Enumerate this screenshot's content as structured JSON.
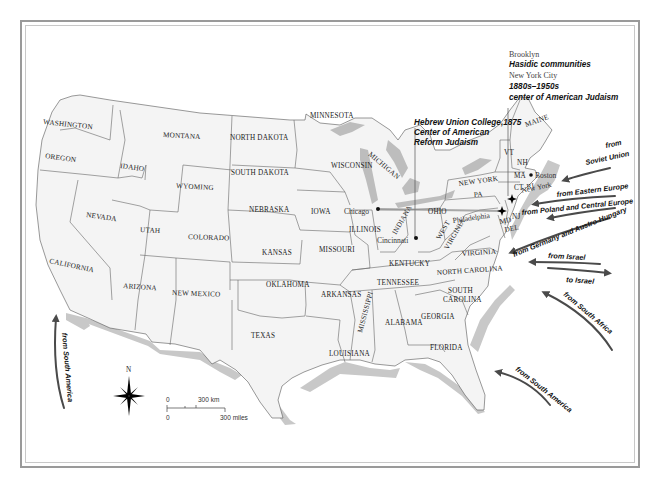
{
  "map": {
    "title": "Jewish immigration to the United States",
    "states": [
      {
        "id": "WA",
        "label": "WASHINGTON",
        "x": 43,
        "y": 124,
        "rot": 6
      },
      {
        "id": "OR",
        "label": "OREGON",
        "x": 45,
        "y": 158,
        "rot": 8
      },
      {
        "id": "CA",
        "label": "CALIFORNIA",
        "x": 49,
        "y": 263,
        "rot": 12
      },
      {
        "id": "ID",
        "label": "IDAHO",
        "x": 120,
        "y": 168,
        "rot": 8
      },
      {
        "id": "NV",
        "label": "NEVADA",
        "x": 86,
        "y": 217,
        "rot": 8
      },
      {
        "id": "MT",
        "label": "MONTANA",
        "x": 163,
        "y": 137,
        "rot": 3
      },
      {
        "id": "WY",
        "label": "WYOMING",
        "x": 176,
        "y": 188,
        "rot": 3
      },
      {
        "id": "UT",
        "label": "UTAH",
        "x": 140,
        "y": 232,
        "rot": 3
      },
      {
        "id": "CO",
        "label": "COLORADO",
        "x": 188,
        "y": 239,
        "rot": 2
      },
      {
        "id": "AZ",
        "label": "ARIZONA",
        "x": 123,
        "y": 288,
        "rot": 4
      },
      {
        "id": "NM",
        "label": "NEW MEXICO",
        "x": 172,
        "y": 295,
        "rot": 2
      },
      {
        "id": "ND",
        "label": "NORTH DAKOTA",
        "x": 230,
        "y": 140,
        "rot": 0
      },
      {
        "id": "SD",
        "label": "SOUTH DAKOTA",
        "x": 231,
        "y": 175,
        "rot": 0
      },
      {
        "id": "NE",
        "label": "NEBRASKA",
        "x": 249,
        "y": 212,
        "rot": 0
      },
      {
        "id": "KS",
        "label": "KANSAS",
        "x": 262,
        "y": 255,
        "rot": 0
      },
      {
        "id": "OK",
        "label": "OKLAHOMA",
        "x": 266,
        "y": 287,
        "rot": 0
      },
      {
        "id": "TX",
        "label": "TEXAS",
        "x": 251,
        "y": 338,
        "rot": 0
      },
      {
        "id": "MN",
        "label": "MINNESOTA",
        "x": 310,
        "y": 118,
        "rot": 0
      },
      {
        "id": "IA",
        "label": "IOWA",
        "x": 311,
        "y": 214,
        "rot": 0
      },
      {
        "id": "MO",
        "label": "MISSOURI",
        "x": 319,
        "y": 252,
        "rot": 0
      },
      {
        "id": "AR",
        "label": "ARKANSAS",
        "x": 321,
        "y": 297,
        "rot": 0
      },
      {
        "id": "LA",
        "label": "LOUISIANA",
        "x": 329,
        "y": 356,
        "rot": 0
      },
      {
        "id": "WI",
        "label": "WISCONSIN",
        "x": 331,
        "y": 168,
        "rot": 0
      },
      {
        "id": "MI",
        "label": "MICHIGAN",
        "x": 368,
        "y": 155,
        "rot": 40
      },
      {
        "id": "IL",
        "label": "ILLINOIS",
        "x": 349,
        "y": 232,
        "rot": 0
      },
      {
        "id": "IN",
        "label": "INDIANA",
        "x": 396,
        "y": 235,
        "rot": -60
      },
      {
        "id": "OH",
        "label": "OHIO",
        "x": 428,
        "y": 214,
        "rot": 0
      },
      {
        "id": "KY",
        "label": "KENTUCKY",
        "x": 389,
        "y": 266,
        "rot": 0
      },
      {
        "id": "TN",
        "label": "TENNESSEE",
        "x": 377,
        "y": 285,
        "rot": 0
      },
      {
        "id": "MS",
        "label": "MISSISSIPPI",
        "x": 362,
        "y": 333,
        "rot": -75
      },
      {
        "id": "AL",
        "label": "ALABAMA",
        "x": 385,
        "y": 325,
        "rot": 0
      },
      {
        "id": "GA",
        "label": "GEORGIA",
        "x": 421,
        "y": 319,
        "rot": 0
      },
      {
        "id": "FL",
        "label": "FLORIDA",
        "x": 430,
        "y": 350,
        "rot": 0
      },
      {
        "id": "SC",
        "label": "SOUTH",
        "x": 448,
        "y": 293,
        "rot": 0
      },
      {
        "id": "SC2",
        "label": "CAROLINA",
        "x": 443,
        "y": 302,
        "rot": 0
      },
      {
        "id": "NC",
        "label": "NORTH CAROLINA",
        "x": 437,
        "y": 275,
        "rot": -4
      },
      {
        "id": "VA",
        "label": "VIRGINIA",
        "x": 462,
        "y": 256,
        "rot": -4
      },
      {
        "id": "WV",
        "label": "WEST",
        "x": 440,
        "y": 240,
        "rot": -60
      },
      {
        "id": "WV2",
        "label": "VIRGINIA",
        "x": 448,
        "y": 250,
        "rot": -60
      },
      {
        "id": "PA",
        "label": "PA",
        "x": 474,
        "y": 197,
        "rot": -4
      },
      {
        "id": "NY",
        "label": "NEW YORK",
        "x": 459,
        "y": 186,
        "rot": -8
      },
      {
        "id": "VT",
        "label": "VT",
        "x": 504,
        "y": 155,
        "rot": 0
      },
      {
        "id": "NH",
        "label": "NH",
        "x": 517,
        "y": 165,
        "rot": 0
      },
      {
        "id": "ME",
        "label": "MAINE",
        "x": 526,
        "y": 127,
        "rot": -20
      },
      {
        "id": "MA",
        "label": "MA",
        "x": 514,
        "y": 178,
        "rot": 0
      },
      {
        "id": "CT",
        "label": "CT",
        "x": 514,
        "y": 190,
        "rot": 0
      },
      {
        "id": "RI",
        "label": "RI",
        "x": 527,
        "y": 189,
        "rot": -10
      },
      {
        "id": "MD",
        "label": "MD",
        "x": 500,
        "y": 224,
        "rot": -10
      },
      {
        "id": "NJ",
        "label": "NJ",
        "x": 512,
        "y": 219,
        "rot": 0
      },
      {
        "id": "DE",
        "label": "DEL",
        "x": 505,
        "y": 232,
        "rot": -10
      }
    ],
    "cities": [
      {
        "name": "Chicago",
        "x": 344,
        "y": 212,
        "dot_x": 378,
        "dot_y": 209
      },
      {
        "name": "Cincinnati",
        "x": 374,
        "y": 241,
        "dot_x": 416,
        "dot_y": 238
      },
      {
        "name": "Boston",
        "x": 535,
        "y": 175,
        "dot_x": 531,
        "dot_y": 175
      },
      {
        "name": "New York",
        "x": 531,
        "y": 187,
        "dot_x": 512,
        "dot_y": 199
      },
      {
        "name": "Philadelphia",
        "x": 454,
        "y": 220,
        "dot_x": 502,
        "dot_y": 211
      }
    ],
    "annotations": {
      "brooklyn": {
        "line1": "Brooklyn",
        "line2": "Hasidic communities"
      },
      "nyc": {
        "line1": "New York City",
        "line2": "1880s–1950s",
        "line3": "center of American Judaism"
      },
      "huc": {
        "line1": "Hebrew Union College,1875",
        "line2": "Center of American",
        "line3": "Reform Judaism"
      }
    },
    "migration_arrows": [
      {
        "label": "from Soviet Union",
        "line1": "from",
        "line2": "Soviet Union",
        "direction": "inbound"
      },
      {
        "label": "from Eastern Europe",
        "direction": "inbound"
      },
      {
        "label": "from Poland and Central Europe",
        "direction": "inbound"
      },
      {
        "label": "from Germany and Austro-Hungary",
        "direction": "inbound"
      },
      {
        "label": "from Israel",
        "direction": "inbound"
      },
      {
        "label": "to Israel",
        "direction": "outbound"
      },
      {
        "label": "from South Africa",
        "direction": "inbound"
      },
      {
        "label": "from South America",
        "direction": "inbound"
      },
      {
        "label": "from South America",
        "direction": "inbound",
        "position": "west"
      }
    ],
    "compass": {
      "north_label": "N"
    },
    "scale_bar": {
      "km_zero": "0",
      "km_label": "300 km",
      "mi_zero": "0",
      "mi_label": "300 miles"
    },
    "colors": {
      "land": "#f4f4f4",
      "coast_shadow": "#c8c8c8",
      "lakes": "#bdbdbd",
      "arrow": "#4a4a4a",
      "frame": "#9a9a9a"
    }
  }
}
